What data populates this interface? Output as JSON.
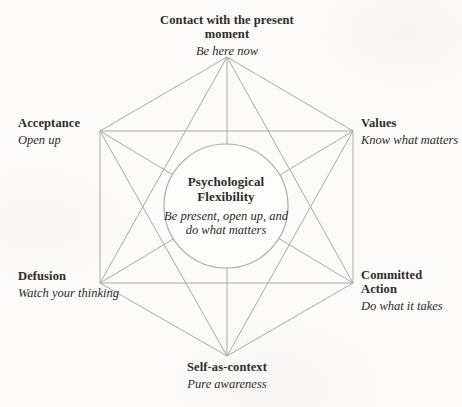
{
  "diagram": {
    "name": "hexaflex-psychological-flexibility",
    "center": {
      "title": "Psychological Flexibility",
      "subtitle": "Be present, open up, and do what matters"
    },
    "nodes": {
      "contact": {
        "title": "Contact with the present moment",
        "subtitle": "Be here now"
      },
      "acceptance": {
        "title": "Acceptance",
        "subtitle": "Open up"
      },
      "values": {
        "title": "Values",
        "subtitle": "Know what matters"
      },
      "defusion": {
        "title": "Defusion",
        "subtitle": "Watch your thinking"
      },
      "committed_action": {
        "title": "Committed Action",
        "subtitle": "Do what it takes"
      },
      "self_as_context": {
        "title": "Self-as-context",
        "subtitle": "Pure awareness"
      }
    },
    "colors": {
      "line": "#a9a9a9",
      "text": "#2e2b28",
      "background": "#fcfbfa",
      "circle_fill": "#fdfdfc",
      "circle_stroke": "#ababab"
    }
  }
}
